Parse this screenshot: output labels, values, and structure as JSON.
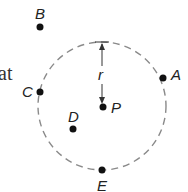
{
  "diagram": {
    "text_fragment": "at",
    "circle": {
      "center_label": "P",
      "radius_label": "r",
      "stroke": "#8a8a8a",
      "style": "dashed"
    },
    "points": [
      {
        "label": "A",
        "position": "on circle (right)"
      },
      {
        "label": "B",
        "position": "outside circle (top-left)"
      },
      {
        "label": "C",
        "position": "on circle (left)"
      },
      {
        "label": "D",
        "position": "inside circle"
      },
      {
        "label": "E",
        "position": "on circle (bottom)"
      },
      {
        "label": "P",
        "position": "center"
      }
    ],
    "point_color": "#111111"
  }
}
